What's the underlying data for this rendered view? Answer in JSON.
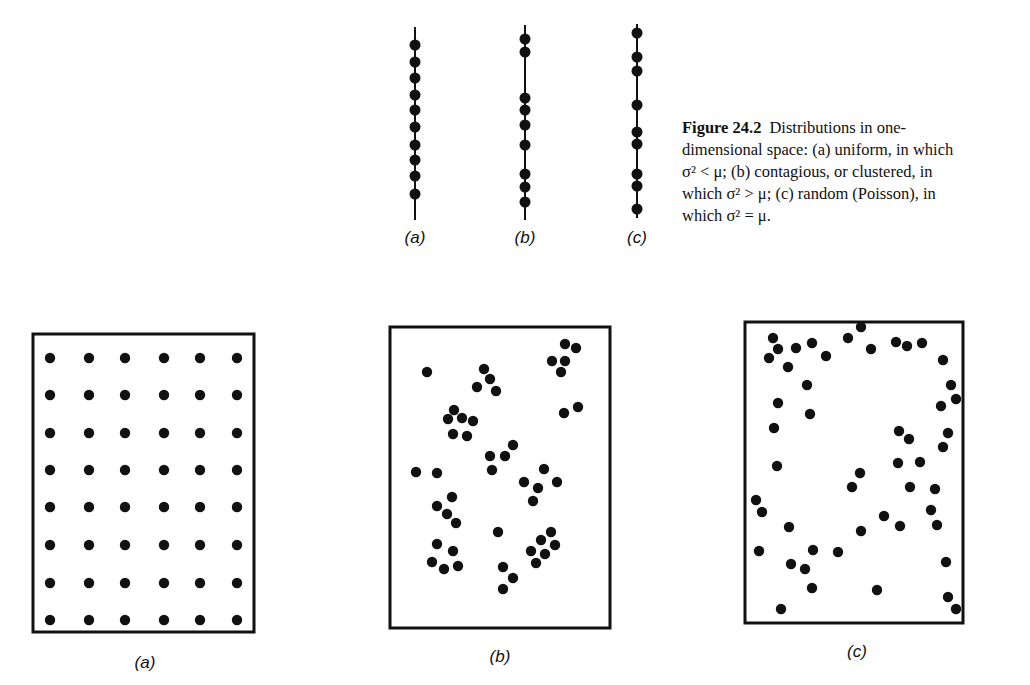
{
  "figure": {
    "number": "Figure 24.2",
    "caption_lines": [
      "Distributions in one-",
      "dimensional space: (a) uniform, in which",
      "σ² < μ; (b) contagious, or clustered, in",
      "which σ² > μ; (c) random (Poisson), in",
      "which σ² = μ."
    ],
    "caption_full": "Figure 24.2 Distributions in one-dimensional space: (a) uniform, in which σ² < μ; (b) contagious, or clustered, in which σ² > μ; (c) random (Poisson), in which σ² = μ."
  },
  "one_dimensional": {
    "panels": [
      {
        "label": "(a)",
        "type": "uniform",
        "line": {
          "x": 415,
          "y1": 27,
          "y2": 220
        },
        "dots_y": [
          45,
          62,
          78,
          95,
          110,
          127,
          145,
          160,
          176,
          194
        ]
      },
      {
        "label": "(b)",
        "type": "contagious",
        "line": {
          "x": 525,
          "y1": 25,
          "y2": 220
        },
        "dots_y": [
          39,
          52,
          98,
          110,
          125,
          145,
          174,
          187,
          202
        ]
      },
      {
        "label": "(c)",
        "type": "random",
        "line": {
          "x": 637,
          "y1": 24,
          "y2": 218
        },
        "dots_y": [
          33,
          57,
          71,
          105,
          132,
          144,
          174,
          186,
          209
        ]
      }
    ],
    "label_y": 243
  },
  "two_dimensional": {
    "panels": [
      {
        "label": "(a)",
        "type": "uniform",
        "box": {
          "x": 33,
          "y": 334,
          "w": 221,
          "h": 298
        },
        "label_pos": {
          "x": 145,
          "y": 668
        },
        "grid": {
          "cols_x": [
            50,
            89,
            125,
            164,
            200,
            237
          ],
          "rows_y": [
            358,
            395,
            433,
            470,
            507,
            545,
            583,
            620
          ]
        }
      },
      {
        "label": "(b)",
        "type": "contagious",
        "box": {
          "x": 390,
          "y": 327,
          "w": 220,
          "h": 301
        },
        "label_pos": {
          "x": 500,
          "y": 662
        },
        "dots": [
          [
            427,
            372
          ],
          [
            484,
            369
          ],
          [
            490,
            379
          ],
          [
            477,
            387
          ],
          [
            496,
            391
          ],
          [
            565,
            344
          ],
          [
            576,
            348
          ],
          [
            552,
            361
          ],
          [
            565,
            361
          ],
          [
            561,
            372
          ],
          [
            454,
            410
          ],
          [
            448,
            419
          ],
          [
            462,
            418
          ],
          [
            473,
            421
          ],
          [
            453,
            434
          ],
          [
            467,
            436
          ],
          [
            578,
            407
          ],
          [
            564,
            413
          ],
          [
            513,
            445
          ],
          [
            490,
            456
          ],
          [
            505,
            456
          ],
          [
            492,
            470
          ],
          [
            416,
            472
          ],
          [
            437,
            473
          ],
          [
            544,
            469
          ],
          [
            524,
            482
          ],
          [
            557,
            482
          ],
          [
            538,
            488
          ],
          [
            533,
            501
          ],
          [
            452,
            497
          ],
          [
            437,
            506
          ],
          [
            447,
            514
          ],
          [
            456,
            523
          ],
          [
            498,
            532
          ],
          [
            437,
            544
          ],
          [
            453,
            551
          ],
          [
            432,
            562
          ],
          [
            444,
            569
          ],
          [
            458,
            566
          ],
          [
            503,
            567
          ],
          [
            513,
            578
          ],
          [
            503,
            589
          ],
          [
            551,
            532
          ],
          [
            541,
            540
          ],
          [
            555,
            545
          ],
          [
            531,
            551
          ],
          [
            545,
            554
          ],
          [
            536,
            563
          ]
        ]
      },
      {
        "label": "(c)",
        "type": "random",
        "box": {
          "x": 745,
          "y": 322,
          "w": 218,
          "h": 301
        },
        "label_pos": {
          "x": 857,
          "y": 657
        },
        "dots": [
          [
            773,
            338
          ],
          [
            778,
            349
          ],
          [
            769,
            358
          ],
          [
            796,
            348
          ],
          [
            812,
            343
          ],
          [
            788,
            367
          ],
          [
            826,
            356
          ],
          [
            848,
            338
          ],
          [
            861,
            327
          ],
          [
            871,
            349
          ],
          [
            896,
            342
          ],
          [
            907,
            346
          ],
          [
            922,
            343
          ],
          [
            943,
            360
          ],
          [
            807,
            385
          ],
          [
            951,
            385
          ],
          [
            956,
            399
          ],
          [
            941,
            406
          ],
          [
            778,
            403
          ],
          [
            810,
            414
          ],
          [
            774,
            428
          ],
          [
            899,
            431
          ],
          [
            909,
            439
          ],
          [
            948,
            433
          ],
          [
            943,
            447
          ],
          [
            777,
            466
          ],
          [
            898,
            463
          ],
          [
            920,
            462
          ],
          [
            860,
            473
          ],
          [
            852,
            487
          ],
          [
            910,
            487
          ],
          [
            935,
            489
          ],
          [
            756,
            500
          ],
          [
            762,
            512
          ],
          [
            789,
            527
          ],
          [
            884,
            516
          ],
          [
            900,
            526
          ],
          [
            931,
            510
          ],
          [
            937,
            525
          ],
          [
            861,
            531
          ],
          [
            759,
            551
          ],
          [
            813,
            550
          ],
          [
            838,
            552
          ],
          [
            791,
            564
          ],
          [
            805,
            569
          ],
          [
            946,
            562
          ],
          [
            812,
            588
          ],
          [
            877,
            590
          ],
          [
            781,
            609
          ],
          [
            948,
            597
          ],
          [
            956,
            609
          ]
        ]
      }
    ]
  },
  "style": {
    "ink": "#111111",
    "background": "#ffffff",
    "dot_radius_1d": 5.5,
    "dot_radius_2d": 5.2
  }
}
